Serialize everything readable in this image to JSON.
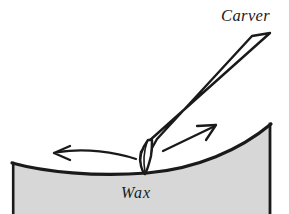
{
  "figure": {
    "type": "technical-line-illustration",
    "background_color": "#ffffff",
    "ink_color": "#1a1a1a",
    "labels": {
      "carver": "Carver",
      "wax": "Wax"
    },
    "wax_block": {
      "name": "wax",
      "fill_color": "#d7d7d7",
      "outline_color": "#1a1a1a",
      "description": "gray block with concave upper surface, vertical left and right walls, cropped at bottom edge",
      "left_wall_top": [
        12,
        163
      ],
      "right_wall_top": [
        271,
        124
      ],
      "surface_low_point": [
        147,
        173
      ]
    },
    "carver_tool": {
      "name": "carver",
      "fill_color": "#ffffff",
      "outline_color": "#1a1a1a",
      "description": "long slender tool drawn as two near-parallel lines running from upper right to a narrow blade tip touching the wax",
      "handle_top_outer": [
        270,
        33
      ],
      "handle_top_inner": [
        252,
        36
      ],
      "tip_point": [
        145,
        174
      ]
    },
    "arrows": [
      {
        "name": "left-motion-arrow",
        "direction": "left",
        "style": "curved",
        "head_point": [
          54,
          153
        ],
        "tail_point": [
          136,
          158
        ],
        "color": "#1a1a1a"
      },
      {
        "name": "right-motion-arrow",
        "direction": "up-right",
        "style": "straight",
        "head_point": [
          216,
          125
        ],
        "tail_point": [
          163,
          150
        ],
        "color": "#1a1a1a"
      }
    ],
    "label_positions": {
      "carver": [
        221,
        21
      ],
      "wax": [
        121,
        198
      ]
    }
  }
}
